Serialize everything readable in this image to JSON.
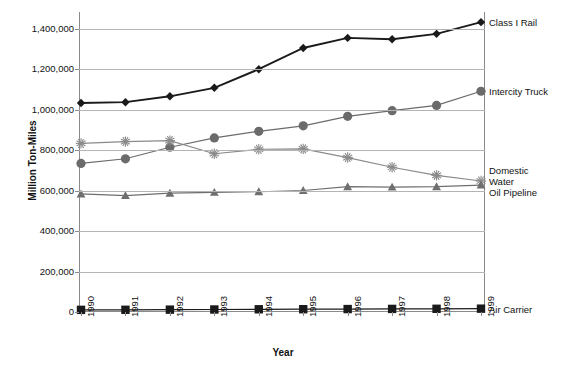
{
  "chart_data": {
    "type": "line",
    "title": "",
    "xlabel": "Year",
    "ylabel": "Million Ton-Miles",
    "categories": [
      "1990",
      "1991",
      "1992",
      "1993",
      "1994",
      "1995",
      "1996",
      "1997",
      "1998",
      "1999"
    ],
    "x": [
      1990,
      1991,
      1992,
      1993,
      1994,
      1995,
      1996,
      1997,
      1998,
      1999
    ],
    "ylim": [
      0,
      1500000
    ],
    "yticks": [
      0,
      200000,
      400000,
      600000,
      800000,
      1000000,
      1200000,
      1400000
    ],
    "ytick_labels": [
      "0",
      "200,000",
      "400,000",
      "600,000",
      "800,000",
      "1,000,000",
      "1,200,000",
      "1,400,000"
    ],
    "grid": true,
    "legend_position": "right-inline-end-of-line",
    "series": [
      {
        "name": "Class I Rail",
        "marker": "diamond",
        "color": "#1a1a1a",
        "values": [
          1034000,
          1038000,
          1067000,
          1109000,
          1201000,
          1306000,
          1356000,
          1349000,
          1376000,
          1434000
        ]
      },
      {
        "name": "Intercity Truck",
        "marker": "circle",
        "color": "#6b6b6b",
        "values": [
          735000,
          758000,
          815000,
          861000,
          894000,
          921000,
          968000,
          996000,
          1022000,
          1092000
        ]
      },
      {
        "name": "Domestic Water",
        "marker": "asterisk",
        "color": "#8a8a8a",
        "values": [
          834000,
          843000,
          848000,
          783000,
          805000,
          807000,
          764000,
          716000,
          676000,
          648000
        ]
      },
      {
        "name": "Oil Pipeline",
        "marker": "triangle",
        "color": "#6f6f6f",
        "values": [
          584000,
          576000,
          588000,
          592000,
          595000,
          601000,
          620000,
          618000,
          620000,
          628000
        ]
      },
      {
        "name": "Air Carrier",
        "marker": "square",
        "color": "#1a1a1a",
        "values": [
          10600,
          11000,
          11600,
          12400,
          13400,
          13800,
          14500,
          15300,
          15900,
          16500
        ]
      }
    ]
  },
  "axes": {
    "y_title": "Million Ton-Miles",
    "x_title": "Year",
    "y_tick_labels": [
      "1,400,000",
      "1,200,000",
      "1,000,000",
      "800,000",
      "600,000",
      "400,000",
      "200,000",
      "0"
    ],
    "x_tick_labels": [
      "1990",
      "1991",
      "1992",
      "1993",
      "1994",
      "1995",
      "1996",
      "1997",
      "1998",
      "1999"
    ]
  },
  "legend": {
    "items": [
      {
        "label": "Class I Rail"
      },
      {
        "label": "Intercity Truck"
      },
      {
        "label": "Domestic"
      },
      {
        "label": "Water"
      },
      {
        "label": "Oil Pipeline"
      },
      {
        "label": "Air Carrier"
      }
    ]
  }
}
